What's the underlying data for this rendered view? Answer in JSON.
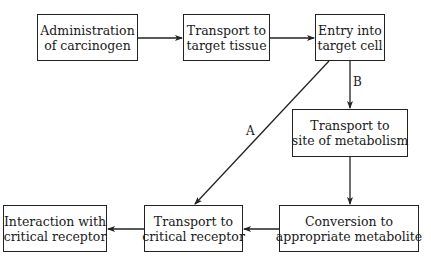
{
  "diagram": {
    "type": "flowchart",
    "nodes": [
      {
        "id": "n1",
        "line1": "Administration",
        "line2": "of carcinogen"
      },
      {
        "id": "n2",
        "line1": "Transport to",
        "line2": "target tissue"
      },
      {
        "id": "n3",
        "line1": "Entry into",
        "line2": "target cell"
      },
      {
        "id": "n4",
        "line1": "Transport to",
        "line2": "site of metabolism"
      },
      {
        "id": "n5",
        "line1": "Conversion to",
        "line2": "appropriate metabolite"
      },
      {
        "id": "n6",
        "line1": "Transport to",
        "line2": "critical receptor"
      },
      {
        "id": "n7",
        "line1": "Interaction with",
        "line2": "critical receptor"
      }
    ],
    "edges": [
      {
        "from": "n1",
        "to": "n2",
        "label": ""
      },
      {
        "from": "n2",
        "to": "n3",
        "label": ""
      },
      {
        "from": "n3",
        "to": "n6",
        "label": "A"
      },
      {
        "from": "n3",
        "to": "n4",
        "label": "B"
      },
      {
        "from": "n4",
        "to": "n5",
        "label": ""
      },
      {
        "from": "n5",
        "to": "n6",
        "label": ""
      },
      {
        "from": "n6",
        "to": "n7",
        "label": ""
      }
    ],
    "path_labels": {
      "a": "A",
      "b": "B"
    }
  }
}
